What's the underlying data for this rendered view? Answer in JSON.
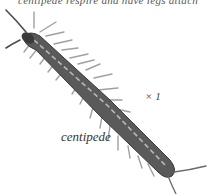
{
  "header": {
    "cut_text": "centipede respire and have legs attached"
  },
  "labels": {
    "scale": "× 1",
    "caption": "centipede"
  },
  "colors": {
    "body": "#5a5a5a",
    "body_dark": "#3a3a3a",
    "legs": "#9a9a9a",
    "stripe": "#b8b8b8",
    "background": "#ffffff"
  },
  "illustration": {
    "subject": "centipede",
    "style": "grayscale drawing"
  }
}
